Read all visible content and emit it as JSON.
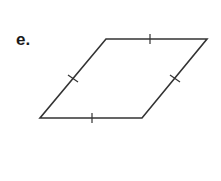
{
  "problem_label": "e.",
  "figure": {
    "shape": "rhombus",
    "sides": [
      {
        "name": "top",
        "tick_marks": 1
      },
      {
        "name": "right",
        "tick_marks": 1
      },
      {
        "name": "bottom",
        "tick_marks": 1
      },
      {
        "name": "left",
        "tick_marks": 1
      }
    ],
    "stroke_color": "#333333"
  }
}
